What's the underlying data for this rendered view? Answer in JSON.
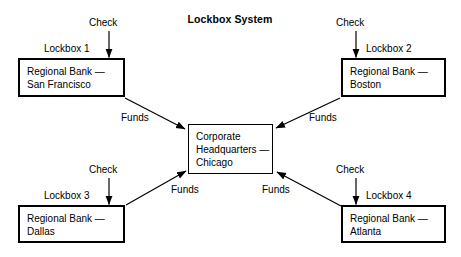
{
  "diagram": {
    "title": "Lockbox System",
    "type": "flow-diagram",
    "hub": {
      "name": "corporate-headquarters",
      "line1": "Corporate",
      "line2": "Headquarters —",
      "line3": "Chicago"
    },
    "nodes": [
      {
        "id": "lockbox-1",
        "lockbox_label": "Lockbox 1",
        "inflow_label": "Check",
        "outflow_label": "Funds",
        "line1": "Regional Bank —",
        "line2": "San Francisco"
      },
      {
        "id": "lockbox-2",
        "lockbox_label": "Lockbox 2",
        "inflow_label": "Check",
        "outflow_label": "Funds",
        "line1": "Regional Bank —",
        "line2": "Boston"
      },
      {
        "id": "lockbox-3",
        "lockbox_label": "Lockbox 3",
        "inflow_label": "Check",
        "outflow_label": "Funds",
        "line1": "Regional Bank —",
        "line2": "Dallas"
      },
      {
        "id": "lockbox-4",
        "lockbox_label": "Lockbox 4",
        "inflow_label": "Check",
        "outflow_label": "Funds",
        "line1": "Regional Bank —",
        "line2": "Atlanta"
      }
    ],
    "colors": {
      "stroke": "#000000",
      "background": "#ffffff",
      "text": "#000000"
    }
  }
}
